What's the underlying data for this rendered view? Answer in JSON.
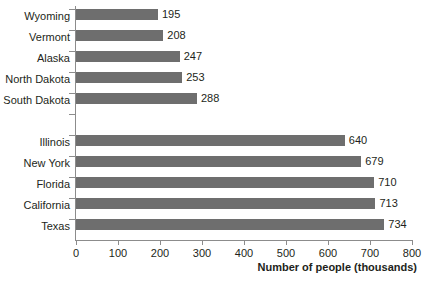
{
  "chart_data": {
    "type": "bar",
    "orientation": "horizontal",
    "title": "",
    "xlabel": "Number of people (thousands)",
    "ylabel": "",
    "xlim": [
      0,
      800
    ],
    "xticks": [
      0,
      100,
      200,
      300,
      400,
      500,
      600,
      700,
      800
    ],
    "grid": false,
    "legend": null,
    "bar_color": "#6e6e6e",
    "axis_color": "#8c8c8c",
    "text_color": "#231f20",
    "categories": [
      "Wyoming",
      "Vermont",
      "Alaska",
      "North Dakota",
      "South Dakota",
      "",
      "Illinois",
      "New York",
      "Florida",
      "California",
      "Texas"
    ],
    "values": [
      195,
      208,
      247,
      253,
      288,
      null,
      640,
      679,
      710,
      713,
      734
    ],
    "value_labels": [
      "195",
      "208",
      "247",
      "253",
      "288",
      "",
      "640",
      "679",
      "710",
      "713",
      "734"
    ],
    "groups": [
      {
        "name": "lowest",
        "categories": [
          "Wyoming",
          "Vermont",
          "Alaska",
          "North Dakota",
          "South Dakota"
        ],
        "values": [
          195,
          208,
          247,
          253,
          288
        ]
      },
      {
        "name": "highest",
        "categories": [
          "Illinois",
          "New York",
          "Florida",
          "California",
          "Texas"
        ],
        "values": [
          640,
          679,
          710,
          713,
          734
        ]
      }
    ]
  }
}
